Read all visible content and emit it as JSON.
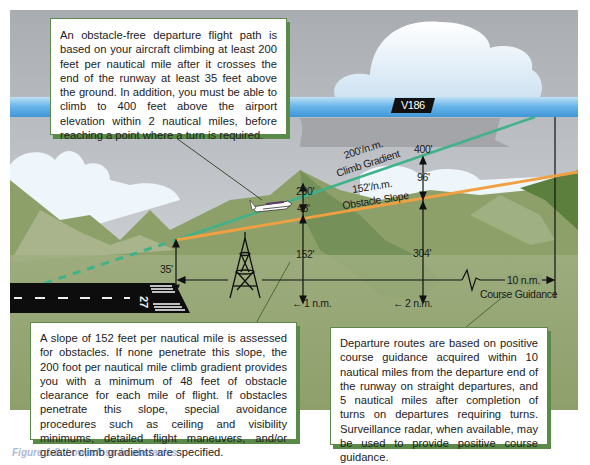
{
  "diagram": {
    "title_callout": {
      "text": "An obstacle-free departure flight path is based on your aircraft climbing at least 200 feet per nautical mile after it crosses the end of the runway at least 35 feet above the ground. In addition, you must be able to climb to 400 feet above the airport elevation within 2 nautical miles, before reaching a point where a turn is required."
    },
    "obstacle_callout": {
      "text": "A slope of 152 feet per nautical mile is assessed for obstacles. If none penetrate this slope, the 200 foot per nautical mile climb gradient provides you with a minimum of 48 feet of obstacle clearance for each mile of flight. If obstacles penetrate this slope, special avoidance procedures such as ceiling and visibility minimums, detailed flight maneuvers, and/or greater climb gradients are specified."
    },
    "guidance_callout": {
      "text": "Departure routes are based on positive course guidance acquired within 10 nautical miles from the departure end of the runway on straight departures, and 5 nautical miles after completion of turns on departures requiring turns. Surveillance radar, when available, may be used to provide positive course guidance."
    },
    "airway": {
      "label": "V186",
      "color": "#5aaee6"
    },
    "climb_gradient": {
      "rate": "200'/n.m.",
      "name": "Climb Gradient",
      "color": "#3fb28a"
    },
    "obstacle_slope": {
      "rate": "152'/n.m.",
      "name": "Obstacle Slope",
      "color": "#f0a040"
    },
    "runway": {
      "number": "27"
    },
    "measurements": {
      "runway_end_height": "35'",
      "one_nm_altitude": "200'",
      "one_nm_clearance": "48'",
      "one_nm_obstacle": "152'",
      "two_nm_altitude": "400'",
      "two_nm_clearance": "96'",
      "two_nm_obstacle": "304'"
    },
    "distances": {
      "one_nm": "1 n.m.",
      "two_nm": "2 n.m.",
      "ten_nm": "10 n.m.",
      "course_guidance": "Course Guidance"
    },
    "caption": "Figure 1-8. Low, close-in obstacles"
  }
}
